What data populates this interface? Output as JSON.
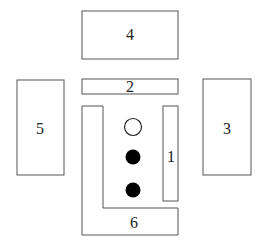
{
  "diagram": {
    "stroke_color": "#555555",
    "fill_color": "#ffffff",
    "boxes": [
      {
        "id": "4",
        "label": "4"
      },
      {
        "id": "2",
        "label": "2"
      },
      {
        "id": "5",
        "label": "5"
      },
      {
        "id": "3",
        "label": "3"
      },
      {
        "id": "1",
        "label": "1"
      },
      {
        "id": "6",
        "label": "6"
      }
    ],
    "circles": [
      {
        "type": "open"
      },
      {
        "type": "filled"
      },
      {
        "type": "filled"
      }
    ]
  }
}
